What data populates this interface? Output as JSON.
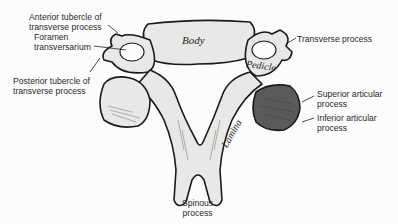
{
  "diagram": {
    "in_figure_labels": {
      "body": "Body",
      "pedicle": "Pedicle",
      "lamina": "Lamina"
    },
    "callouts": [
      {
        "id": "anterior-tubercle",
        "text": "Anterior tubercle of\ntransverse process"
      },
      {
        "id": "foramen-transversarium",
        "text": "Foramen\ntransversarium"
      },
      {
        "id": "posterior-tubercle",
        "text": "Posterior tubercle of\ntransverse process"
      },
      {
        "id": "transverse-process",
        "text": "Transverse process"
      },
      {
        "id": "superior-articular",
        "text": "Superior articular\nprocess"
      },
      {
        "id": "inferior-articular",
        "text": "Inferior articular\nprocess"
      },
      {
        "id": "spinous-process",
        "text": "Spinous\nprocess"
      }
    ]
  }
}
